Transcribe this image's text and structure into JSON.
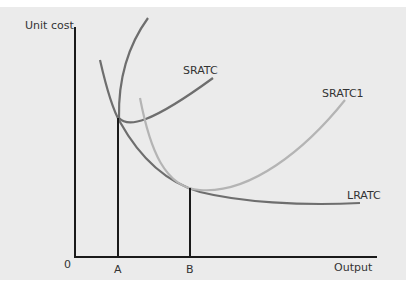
{
  "diagram": {
    "y_axis_label": "Unit cost",
    "x_axis_label": "Output",
    "origin_label": "0",
    "x_markers": [
      {
        "label": "A"
      },
      {
        "label": "B"
      }
    ],
    "curves": [
      {
        "label": "SRATC",
        "color": "#6e6e6e"
      },
      {
        "label": "SRATC1",
        "color": "#b4b4b4"
      },
      {
        "label": "LRATC",
        "color": "#6e6e6e"
      }
    ],
    "colors": {
      "background": "#ebebeb",
      "axes": "#1a1a1a",
      "text": "#333333"
    }
  }
}
